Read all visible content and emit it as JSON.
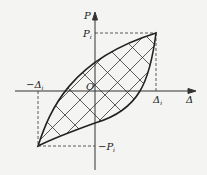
{
  "diagram": {
    "axes": {
      "y_label": "P",
      "x_label": "Δ",
      "origin_label": "O"
    },
    "labels": {
      "p_pos": "P",
      "p_pos_sub": "i",
      "p_neg": "−P",
      "p_neg_sub": "i",
      "d_pos": "Δ",
      "d_pos_sub": "i",
      "d_neg": "−Δ",
      "d_neg_sub": "i"
    },
    "colors": {
      "stroke": "#222222",
      "background": "#f4f4f2"
    }
  }
}
